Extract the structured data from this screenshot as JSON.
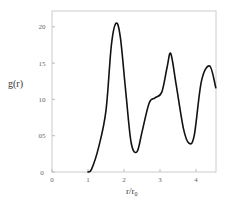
{
  "chart_data": {
    "type": "line",
    "title": "",
    "xlabel": "r/r₀",
    "ylabel": "g(r)",
    "xlim": [
      0,
      4.55
    ],
    "ylim": [
      0,
      2.2
    ],
    "xticks": [
      "0",
      "1",
      "2",
      "3",
      "4"
    ],
    "yticks": [
      "0",
      "05",
      "10",
      "15",
      "20"
    ],
    "grid": false,
    "legend": null,
    "series": [
      {
        "name": "g(r)",
        "x": [
          1.0,
          1.1,
          1.3,
          1.5,
          1.65,
          1.78,
          1.9,
          2.05,
          2.2,
          2.36,
          2.5,
          2.7,
          2.86,
          3.05,
          3.2,
          3.3,
          3.45,
          3.65,
          3.8,
          3.95,
          4.15,
          4.38,
          4.55
        ],
        "y": [
          0.0,
          0.04,
          0.35,
          0.85,
          1.75,
          2.05,
          1.85,
          1.1,
          0.4,
          0.28,
          0.55,
          0.95,
          1.02,
          1.1,
          1.45,
          1.63,
          1.2,
          0.6,
          0.4,
          0.5,
          1.25,
          1.46,
          1.16
        ]
      }
    ]
  },
  "labels": {
    "ylabel": "g(r)",
    "xlabel_main": "r/r",
    "xlabel_sub": "0",
    "yticks": [
      "20",
      "15",
      "10",
      "05",
      "0"
    ],
    "xticks": [
      "0",
      "1",
      "2",
      "3",
      "4"
    ]
  },
  "colors": {
    "curve": "#111111",
    "frame": "#cccccc",
    "text": "#555555"
  }
}
